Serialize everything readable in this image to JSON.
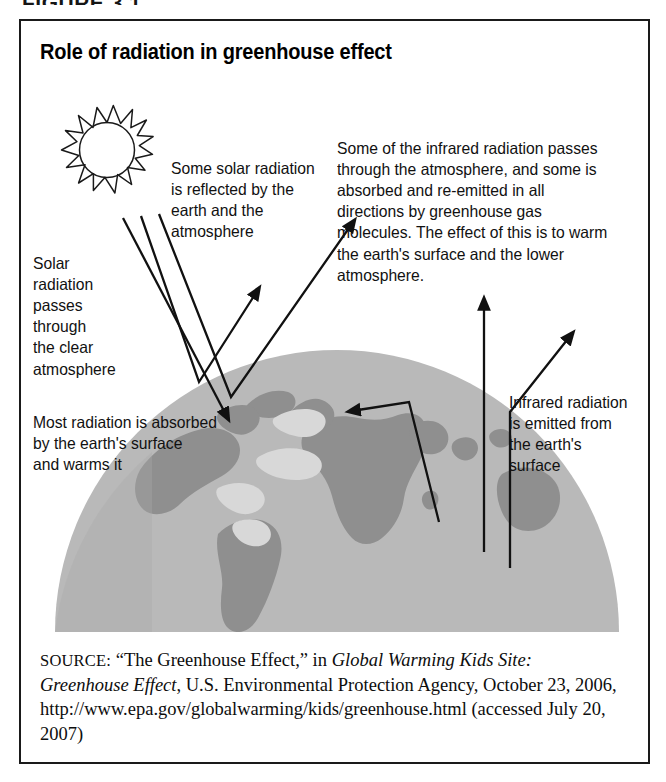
{
  "figure": {
    "label": "FIGURE 3.1",
    "title": "Role of radiation in greenhouse effect"
  },
  "annotations": {
    "solar_passes": "Solar\nradiation\npasses\nthrough\nthe clear\natmosphere",
    "reflected": "Some solar radiation\nis reflected by the\nearth and the\natmosphere",
    "absorbed": "Most radiation is absorbed\nby the earth's surface\nand warms it",
    "infrared_long": "Some of the infrared radiation passes\nthrough the atmosphere, and some is\nabsorbed and re-emitted in all\ndirections by greenhouse gas\nmolecules. The effect of this is to warm\nthe earth's surface and the lower\natmosphere.",
    "infrared_emitted": "Infrared radiation\nis emitted from\nthe earth's\nsurface"
  },
  "diagram": {
    "sun_label": "sun-illustration",
    "earth_label": "earth-hemisphere-illustration",
    "ray_count": 16,
    "arrows": [
      {
        "name": "incoming-solar-ray-1",
        "direction": "down-right"
      },
      {
        "name": "incoming-solar-ray-2",
        "direction": "down-right-reflect-up"
      },
      {
        "name": "incoming-solar-ray-3",
        "direction": "down-right-reflect-up"
      },
      {
        "name": "outgoing-infrared-vertical",
        "direction": "up"
      },
      {
        "name": "outgoing-infrared-diagonal",
        "direction": "up-right"
      },
      {
        "name": "re-emitted-infrared-left",
        "direction": "up-then-left"
      }
    ]
  },
  "source": {
    "label": "SOURCE:",
    "part1": " “The Greenhouse Effect,” in ",
    "italic1": "Global Warming Kids Site:",
    "italic2": "Greenhouse Effect",
    "part2": ", U.S. Environmental Protection Agency, October 23, 2006, http://www.epa.gov/globalwarming/kids/greenhouse.html (accessed July 20, 2007)"
  },
  "colors": {
    "ink": "#111111",
    "frame": "#1a1a1a",
    "ocean": "#b9b9b9",
    "land": "#8f8f8f",
    "land_light": "#d2d2d2",
    "page": "#ffffff"
  }
}
